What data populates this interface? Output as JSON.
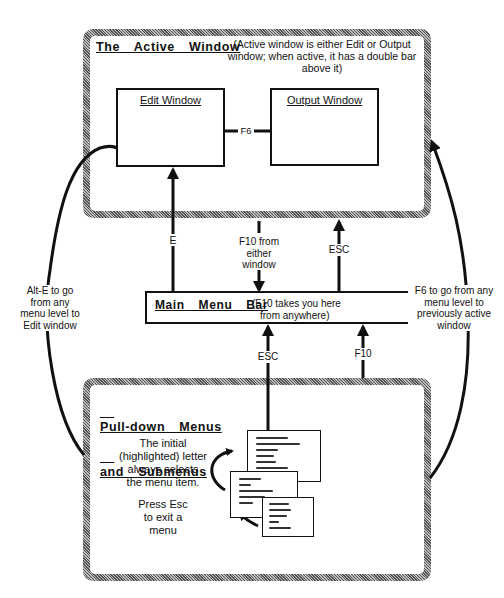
{
  "diagram": {
    "active_window": {
      "title": "The  Active  Window",
      "note_line1": "(Active window is either Edit or Output",
      "note_line2": "window; when active, it has a double bar",
      "note_line3": "above it)",
      "edit_window": {
        "label": "Edit Window"
      },
      "output_window": {
        "label": "Output Window"
      },
      "switch_key": "F6"
    },
    "main_menu_bar": {
      "title": "Main  Menu  Bar",
      "note_line1": "(F10 takes you here",
      "note_line2": "from anywhere)"
    },
    "pulldown": {
      "title_line1": "Pull-down  Menus",
      "title_line2": "and  Submenus",
      "note1_line1": "The initial",
      "note1_line2": "(highlighted) letter",
      "note1_line3": "always selects",
      "note1_line4": "the menu item.",
      "note2_line1": "Press Esc",
      "note2_line2": "to exit a",
      "note2_line3": "menu"
    },
    "arrows": {
      "edit_from_menu": "E",
      "f10_from_window_line1": "F10 from",
      "f10_from_window_line2": "either",
      "f10_from_window_line3": "window",
      "esc_to_window": "ESC",
      "esc_to_menubar": "ESC",
      "f10_to_menubar": "F10",
      "alt_e_line1": "Alt-E to go",
      "alt_e_line2": "from any",
      "alt_e_line3": "menu level to",
      "alt_e_line4": "Edit window",
      "f6_line1": "F6 to go from any",
      "f6_line2": "menu level to",
      "f6_line3": "previously active",
      "f6_line4": "window"
    },
    "colors": {
      "line": "#111111",
      "frame_hatch_dark": "#555555",
      "frame_hatch_light": "#bbbbbb",
      "background": "#ffffff"
    }
  }
}
